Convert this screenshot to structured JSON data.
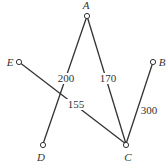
{
  "diagram": {
    "type": "weighted-graph",
    "nodes": [
      {
        "id": "A",
        "label": "A"
      },
      {
        "id": "B",
        "label": "B"
      },
      {
        "id": "C",
        "label": "C"
      },
      {
        "id": "D",
        "label": "D"
      },
      {
        "id": "E",
        "label": "E"
      }
    ],
    "edges": [
      {
        "from": "A",
        "to": "D",
        "weight": "200"
      },
      {
        "from": "A",
        "to": "C",
        "weight": "170"
      },
      {
        "from": "E",
        "to": "C",
        "weight": "155"
      },
      {
        "from": "B",
        "to": "C",
        "weight": "300"
      }
    ]
  }
}
